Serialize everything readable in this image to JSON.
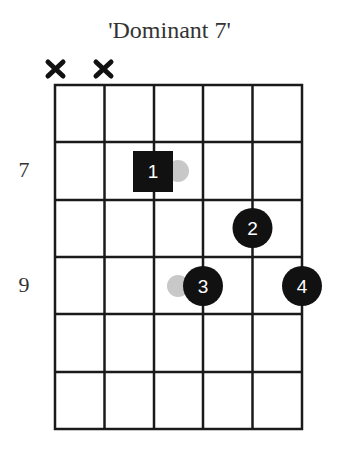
{
  "diagram": {
    "title": "'Dominant 7'",
    "type": "guitar-chord-diagram",
    "strings": 6,
    "fret_rows": 6,
    "muted_strings": [
      1,
      2
    ],
    "fret_labels": [
      {
        "row": 2,
        "label": "7"
      },
      {
        "row": 4,
        "label": "9"
      }
    ],
    "fingers": [
      {
        "finger": "1",
        "string": 3,
        "row": 2,
        "shape": "square",
        "root": true
      },
      {
        "finger": "2",
        "string": 5,
        "row": 3,
        "shape": "circle",
        "root": false
      },
      {
        "finger": "3",
        "string": 4,
        "row": 4,
        "shape": "circle",
        "root": false
      },
      {
        "finger": "4",
        "string": 6,
        "row": 4,
        "shape": "circle",
        "root": false
      }
    ],
    "ghost_notes": [
      {
        "near_finger": "1",
        "side": "right"
      },
      {
        "near_finger": "3",
        "side": "left"
      }
    ],
    "colors": {
      "grid": "#1a1a1a",
      "marker": "#111111",
      "marker_text": "#ffffff",
      "ghost": "#c8c8c8",
      "text": "#333333"
    }
  }
}
